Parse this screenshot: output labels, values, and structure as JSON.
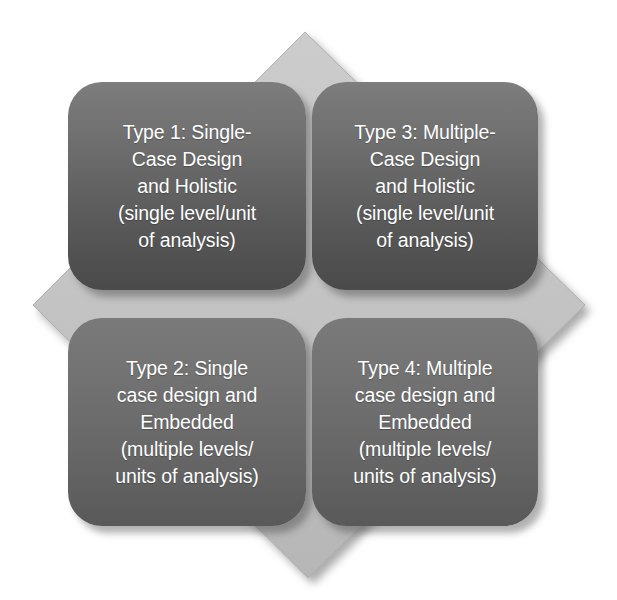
{
  "figure": {
    "background_color": "#ffffff",
    "diamond": {
      "fill_color": "#c3c3c3",
      "edge_color": "#b2b2b2",
      "shadow_color": "#9a9a9a",
      "points": {
        "top": {
          "x": 305,
          "y": 32
        },
        "right": {
          "x": 585,
          "y": 305
        },
        "bottom": {
          "x": 308,
          "y": 578
        },
        "left": {
          "x": 33,
          "y": 305
        }
      }
    },
    "card_colors": {
      "top_row_gradient_start": "#7d7d7d",
      "top_row_gradient_end": "#4a4a4a",
      "bottom_row_gradient_start": "#7a7a7a",
      "bottom_row_gradient_end": "#595959",
      "text_color": "#ffffff"
    }
  },
  "cards": [
    {
      "id": "type-1",
      "position": "top-left",
      "label": "Type 1: Single-\nCase Design\nand Holistic\n(single level/unit\nof analysis)",
      "lines": [
        "Type 1: Single-",
        "Case Design",
        "and Holistic",
        "(single level/unit",
        "of analysis)"
      ]
    },
    {
      "id": "type-3",
      "position": "top-right",
      "label": "Type 3: Multiple-\nCase Design\nand Holistic\n(single level/unit\nof analysis)",
      "lines": [
        "Type 3: Multiple-",
        "Case Design",
        "and Holistic",
        "(single level/unit",
        "of analysis)"
      ]
    },
    {
      "id": "type-2",
      "position": "bottom-left",
      "label": "Type 2: Single\ncase design and\nEmbedded\n(multiple levels/\nunits of analysis)",
      "lines": [
        "Type 2: Single",
        "case design and",
        "Embedded",
        "(multiple levels/",
        "units of analysis)"
      ]
    },
    {
      "id": "type-4",
      "position": "bottom-right",
      "label": "Type 4: Multiple\ncase design and\nEmbedded\n(multiple levels/\nunits of analysis)",
      "lines": [
        "Type 4: Multiple",
        "case design and",
        "Embedded",
        "(multiple levels/",
        "units of analysis)"
      ]
    }
  ]
}
